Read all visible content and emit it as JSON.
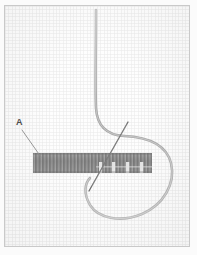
{
  "figure": {
    "kind": "embroidery-stitch-diagram",
    "background_color": "#fcfcfc",
    "frame_color": "#c9c9c9",
    "fabric": {
      "name": "even-weave-fabric-grid",
      "line_color": "#d0d0d0",
      "cell_size_px": 3.4
    },
    "labels": [
      {
        "id": "a",
        "text": "A",
        "x": 16,
        "y": 118
      }
    ],
    "leader_line": {
      "name": "leader-line-a",
      "color": "#8f8f8f",
      "from_x": 22,
      "from_y": 130,
      "to_x": 40,
      "to_y": 156
    },
    "stitch_band": {
      "name": "satin-stitch-band",
      "x": 33,
      "y": 153,
      "width": 119,
      "height": 20,
      "fill_color": "#8a8a8a",
      "stitch_color": "#6e6e6e",
      "stitch_count": 34,
      "open_gap_count": 4
    },
    "thread": {
      "name": "working-thread-loop",
      "color": "#a9a9a9",
      "width_px": 2.6,
      "entry_x": 96,
      "entry_y": 10,
      "loop_right_x": 172,
      "loop_bottom_y": 216
    },
    "needle": {
      "name": "needle",
      "color": "#6b6b6b",
      "top_x": 128,
      "top_y": 122,
      "tip_x": 89,
      "tip_y": 191
    }
  }
}
